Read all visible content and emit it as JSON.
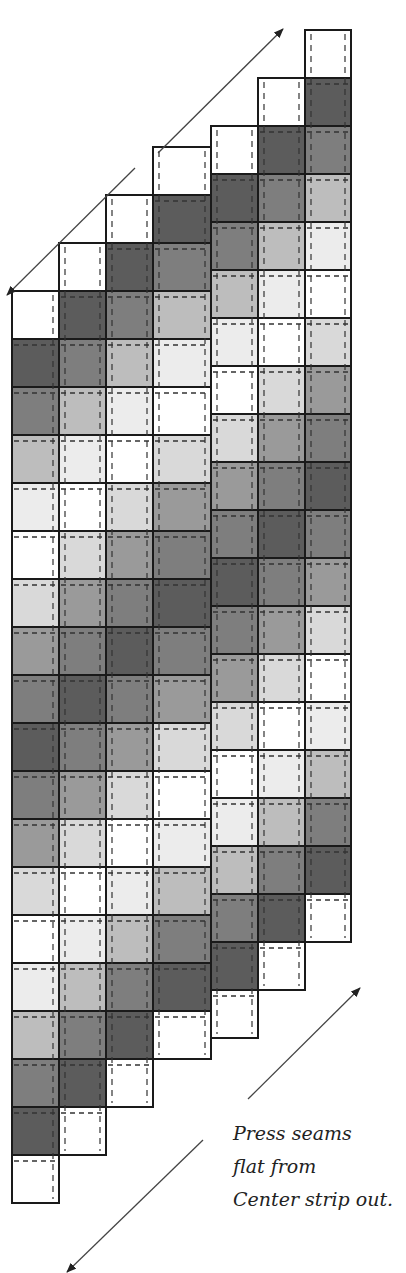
{
  "diagram": {
    "colors": {
      "W": "#ffffff",
      "L1": "#ececec",
      "L2": "#d9d9d9",
      "M1": "#bdbdbd",
      "M2": "#9a9a9a",
      "D1": "#7e7e7e",
      "D2": "#5c5c5c",
      "outline": "#1a1a1a",
      "dash": "#333333",
      "arrow": "#444444"
    },
    "cell_height": 48,
    "columns": [
      {
        "x": 12,
        "width": 47,
        "top": 291,
        "cells": [
          "W",
          "D2",
          "D1",
          "M1",
          "L1",
          "W",
          "L2",
          "M2",
          "D1",
          "D2",
          "D1",
          "M2",
          "L2",
          "W",
          "L1",
          "M1",
          "D1",
          "D2",
          "W"
        ]
      },
      {
        "x": 59,
        "width": 47,
        "top": 243,
        "cells": [
          "W",
          "D2",
          "D1",
          "M1",
          "L1",
          "W",
          "L2",
          "M2",
          "D1",
          "D2",
          "D1",
          "M2",
          "L2",
          "W",
          "L1",
          "M1",
          "D1",
          "D2",
          "W"
        ]
      },
      {
        "x": 106,
        "width": 47,
        "top": 195,
        "cells": [
          "W",
          "D2",
          "D1",
          "M1",
          "L1",
          "W",
          "L2",
          "M2",
          "D1",
          "D2",
          "D1",
          "M2",
          "L2",
          "W",
          "L1",
          "M1",
          "D1",
          "D2",
          "W"
        ]
      },
      {
        "x": 153,
        "width": 58,
        "top": 147,
        "cells": [
          "W",
          "D2",
          "D1",
          "M1",
          "L1",
          "W",
          "L2",
          "M2",
          "D1",
          "D2",
          "D1",
          "M2",
          "L2",
          "W",
          "L1",
          "M1",
          "D1",
          "D2",
          "W"
        ]
      },
      {
        "x": 211,
        "width": 47,
        "top": 126,
        "cells": [
          "W",
          "D2",
          "D1",
          "M1",
          "L1",
          "W",
          "L2",
          "M2",
          "D1",
          "D2",
          "D1",
          "M2",
          "L2",
          "W",
          "L1",
          "M1",
          "D1",
          "D2",
          "W"
        ]
      },
      {
        "x": 258,
        "width": 47,
        "top": 78,
        "cells": [
          "W",
          "D2",
          "D1",
          "M1",
          "L1",
          "W",
          "L2",
          "M2",
          "D1",
          "D2",
          "D1",
          "M2",
          "L2",
          "W",
          "L1",
          "M1",
          "D1",
          "D2",
          "W"
        ]
      },
      {
        "x": 305,
        "width": 46,
        "top": 30,
        "cells": [
          "W",
          "D2",
          "D1",
          "M1",
          "L1",
          "W",
          "L2",
          "M2",
          "D1",
          "D2",
          "D1",
          "M2",
          "L2",
          "W",
          "L1",
          "M1",
          "D1",
          "D2",
          "W"
        ]
      }
    ],
    "arrows": [
      {
        "name": "top-arrow-up-right",
        "x1": 158,
        "y1": 153,
        "x2": 283,
        "y2": 29
      },
      {
        "name": "top-arrow-down-left",
        "x1": 135,
        "y1": 168,
        "x2": 7,
        "y2": 295
      },
      {
        "name": "bottom-arrow-up-right",
        "x1": 248,
        "y1": 1099,
        "x2": 360,
        "y2": 988
      },
      {
        "name": "bottom-arrow-down-left",
        "x1": 203,
        "y1": 1140,
        "x2": 67,
        "y2": 1272
      }
    ],
    "caption": [
      "Press seams",
      "flat from",
      "Center strip out."
    ]
  }
}
